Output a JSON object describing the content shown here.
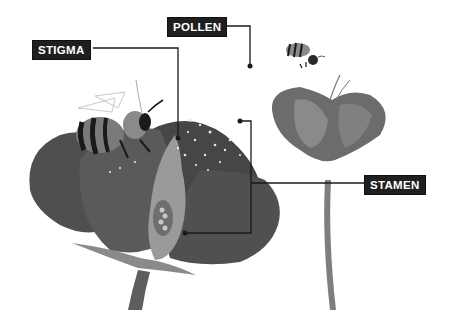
{
  "diagram": {
    "labels": [
      {
        "id": "stigma",
        "text": "STIGMA"
      },
      {
        "id": "pollen",
        "text": "POLLEN"
      },
      {
        "id": "stamen",
        "text": "STAMEN"
      }
    ],
    "colors": {
      "label_bg": "#1f1f1f",
      "label_text": "#ffffff",
      "leader_line": "#1a1a1a",
      "petal_dark": "#4a4a4a",
      "petal_mid": "#6a6a6a",
      "petal_light": "#8c8c8c",
      "stem": "#7a7a7a"
    }
  }
}
